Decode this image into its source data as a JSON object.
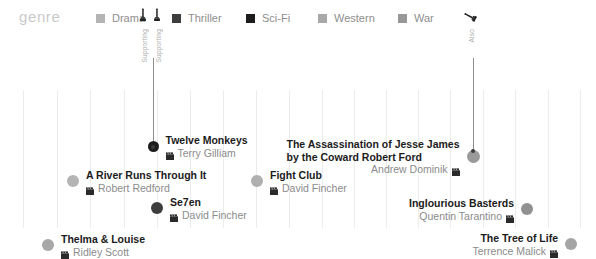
{
  "legend": {
    "title": "genre",
    "items": [
      {
        "label": "Drama",
        "color": "#b4b4b4",
        "x": 96,
        "icon": "legend-swatch"
      },
      {
        "label": "Thriller",
        "color": "#3d3d3d",
        "x": 172,
        "icon": "legend-swatch"
      },
      {
        "label": "Sci-Fi",
        "color": "#1c1c1c",
        "x": 246,
        "icon": "legend-swatch"
      },
      {
        "label": "Western",
        "color": "#a8a8a8",
        "x": 318,
        "icon": "legend-swatch"
      },
      {
        "label": "War",
        "color": "#989898",
        "x": 398,
        "icon": "legend-swatch"
      }
    ]
  },
  "axis": {
    "ticks": [
      {
        "label": "1990",
        "x": 23
      },
      {
        "label": "1995",
        "x": 157
      },
      {
        "label": "2000",
        "x": 289
      },
      {
        "label": "2005",
        "x": 418
      },
      {
        "label": "2010",
        "x": 548
      }
    ],
    "gridlines": [
      23,
      57,
      90,
      124,
      157,
      190,
      223,
      256,
      289,
      322,
      354,
      386,
      418,
      450,
      483,
      515,
      548,
      580
    ]
  },
  "chart_data": {
    "type": "scatter",
    "title": "genre",
    "xlabel": "",
    "ylabel": "",
    "xlim": [
      1990,
      2011
    ],
    "grid": true,
    "legend_position": "top",
    "categories": [
      "Drama",
      "Thriller",
      "Sci-Fi",
      "Western",
      "War"
    ],
    "points": [
      {
        "title": "Twelve Monkeys",
        "director": "Terry Gilliam",
        "genre": "Sci-Fi",
        "color": "#1c1c1c",
        "x": 153,
        "y": 113,
        "dot": 11,
        "align": "left",
        "awards": [
          "Supporting",
          "Supporting"
        ]
      },
      {
        "title": "The Assassination of Jesse James",
        "title_line2": "by the Coward Robert Ford",
        "director": "Andrew Dominik",
        "genre": "Western",
        "color": "#9a9a9a",
        "x": 473,
        "y": 117,
        "dot": 13,
        "align": "right",
        "awards": [
          "Also"
        ]
      },
      {
        "title": "A River Runs Through It",
        "director": "Robert Redford",
        "genre": "Drama",
        "color": "#b4b4b4",
        "x": 73,
        "y": 148,
        "dot": 12,
        "align": "left",
        "awards": []
      },
      {
        "title": "Fight Club",
        "director": "David Fincher",
        "genre": "Drama",
        "color": "#b0b0b0",
        "x": 257,
        "y": 148,
        "dot": 12,
        "align": "left",
        "awards": []
      },
      {
        "title": "Se7en",
        "director": "David Fincher",
        "genre": "Thriller",
        "color": "#3d3d3d",
        "x": 157,
        "y": 175,
        "dot": 12,
        "align": "left",
        "awards": []
      },
      {
        "title": "Inglourious Basterds",
        "director": "Quentin Tarantino",
        "genre": "War",
        "color": "#919191",
        "x": 527,
        "y": 176,
        "dot": 12,
        "align": "right",
        "awards": []
      },
      {
        "title": "Thelma & Louise",
        "director": "Ridley Scott",
        "genre": "Drama",
        "color": "#a8a8a8",
        "x": 48,
        "y": 212,
        "dot": 12,
        "align": "left",
        "awards": []
      },
      {
        "title": "The Tree of Life",
        "director": "Terrence Malick",
        "genre": "Drama",
        "color": "#a5a5a5",
        "x": 571,
        "y": 211,
        "dot": 12,
        "align": "right",
        "awards": []
      }
    ]
  }
}
